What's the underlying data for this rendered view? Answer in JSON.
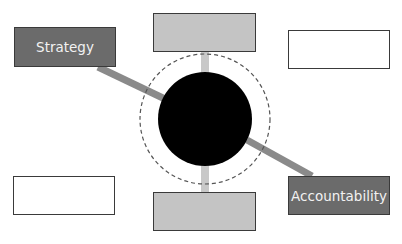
{
  "diagram": {
    "colors": {
      "dark_box": "#6b6b6b",
      "light_box": "#c4c4c4",
      "empty_box": "#ffffff",
      "border": "#3a3a3a",
      "connector_dark": "#8a8a8a",
      "connector_light": "#c8c8c8",
      "center": "#000000",
      "ring": "#555555"
    },
    "center": {
      "cx": 205,
      "cy": 119,
      "r": 47,
      "ring_r": 65
    },
    "boxes": [
      {
        "id": "strategy",
        "label": "Strategy",
        "x": 14,
        "y": 27,
        "w": 102,
        "h": 40,
        "style": "dark"
      },
      {
        "id": "top",
        "label": "",
        "x": 153,
        "y": 13,
        "w": 103,
        "h": 39,
        "style": "light"
      },
      {
        "id": "top-right",
        "label": "",
        "x": 288,
        "y": 30,
        "w": 102,
        "h": 39,
        "style": "empty"
      },
      {
        "id": "bottom-left",
        "label": "",
        "x": 13,
        "y": 176,
        "w": 102,
        "h": 39,
        "style": "empty"
      },
      {
        "id": "bottom",
        "label": "",
        "x": 153,
        "y": 192,
        "w": 103,
        "h": 39,
        "style": "light"
      },
      {
        "id": "accountability",
        "label": "Accountability",
        "x": 288,
        "y": 176,
        "w": 102,
        "h": 39,
        "style": "dark"
      }
    ],
    "connectors": [
      {
        "from": "strategy",
        "x1": 98,
        "y1": 67,
        "x2": 165,
        "y2": 99,
        "color": "dark"
      },
      {
        "from": "top",
        "x1": 205,
        "y1": 52,
        "x2": 205,
        "y2": 74,
        "color": "light"
      },
      {
        "from": "bottom",
        "x1": 205,
        "y1": 164,
        "x2": 205,
        "y2": 192,
        "color": "light"
      },
      {
        "from": "accountability",
        "x1": 247,
        "y1": 140,
        "x2": 312,
        "y2": 176,
        "color": "dark"
      }
    ]
  }
}
